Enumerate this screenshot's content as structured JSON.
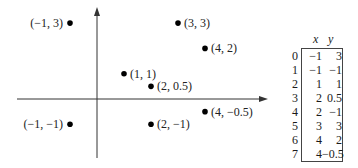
{
  "chart_data": {
    "type": "scatter",
    "title": "",
    "xlabel": "",
    "ylabel": "",
    "axes": {
      "origin_visible": true,
      "arrows": [
        "x-right",
        "y-up"
      ],
      "grid": false,
      "ticks": false
    },
    "xlim": [
      -2.9,
      6.3
    ],
    "ylim": [
      -2.3,
      3.6
    ],
    "points": [
      {
        "x": -1,
        "y": 3,
        "label": "(−1, 3)",
        "label_side": "left"
      },
      {
        "x": -1,
        "y": -1,
        "label": "(−1, −1)",
        "label_side": "left"
      },
      {
        "x": 1,
        "y": 1,
        "label": "(1, 1)",
        "label_side": "right"
      },
      {
        "x": 2,
        "y": 0.5,
        "label": "(2, 0.5)",
        "label_side": "right"
      },
      {
        "x": 2,
        "y": -1,
        "label": "(2, −1)",
        "label_side": "right"
      },
      {
        "x": 3,
        "y": 3,
        "label": "(3, 3)",
        "label_side": "right"
      },
      {
        "x": 4,
        "y": 2,
        "label": "(4, 2)",
        "label_side": "right"
      },
      {
        "x": 4,
        "y": -0.5,
        "label": "(4, −0.5)",
        "label_side": "right"
      }
    ],
    "table": {
      "columns": [
        "x",
        "y"
      ],
      "index": [
        "0",
        "1",
        "2",
        "3",
        "4",
        "5",
        "6",
        "7"
      ],
      "rows": [
        [
          "−1",
          "3"
        ],
        [
          "−1",
          "−1"
        ],
        [
          "1",
          "1"
        ],
        [
          "2",
          "0.5"
        ],
        [
          "2",
          "−1"
        ],
        [
          "3",
          "3"
        ],
        [
          "4",
          "2"
        ],
        [
          "4",
          "−0.5"
        ]
      ]
    }
  },
  "style": {
    "axis_color": "#333333",
    "point_color": "#000000",
    "text_color": "#222222"
  }
}
